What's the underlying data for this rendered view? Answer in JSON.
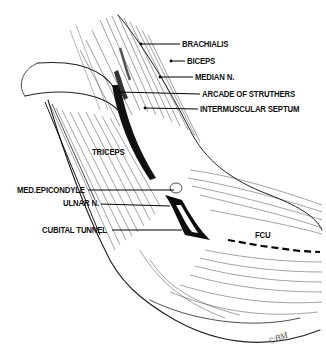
{
  "figure": {
    "signature": "©BM"
  },
  "labels": [
    {
      "id": "brachialis",
      "text": "BRACHIALIS",
      "x": 182,
      "y": 40,
      "lead": [
        [
          141,
          44
        ],
        [
          180,
          44
        ]
      ]
    },
    {
      "id": "biceps",
      "text": "BICEPS",
      "x": 187,
      "y": 57,
      "lead": [
        [
          171,
          61
        ],
        [
          185,
          61
        ]
      ]
    },
    {
      "id": "median-n",
      "text": "MEDIAN N.",
      "x": 195,
      "y": 73,
      "lead": [
        [
          160,
          77
        ],
        [
          193,
          77
        ]
      ]
    },
    {
      "id": "arcade-of-struthers",
      "text": "ARCADE OF STRUTHERS",
      "x": 202,
      "y": 90,
      "lead": [
        [
          118,
          92
        ],
        [
          200,
          94
        ]
      ]
    },
    {
      "id": "intermuscular-septum",
      "text": "INTERMUSCULAR SEPTUM",
      "x": 200,
      "y": 105,
      "lead": [
        [
          145,
          108
        ],
        [
          198,
          109
        ]
      ]
    },
    {
      "id": "triceps",
      "text": "TRICEPS",
      "x": 92,
      "y": 148,
      "lead": []
    },
    {
      "id": "med-epicondyle",
      "text": "MED.EPICONDYLE",
      "x": 17,
      "y": 186,
      "lead": [
        [
          88,
          190
        ],
        [
          174,
          190
        ]
      ]
    },
    {
      "id": "ulnar-n",
      "text": "ULNAR N.",
      "x": 63,
      "y": 199,
      "lead": [
        [
          101,
          204
        ],
        [
          170,
          206
        ]
      ]
    },
    {
      "id": "cubital-tunnel",
      "text": "CUBITAL TUNNEL",
      "x": 42,
      "y": 226,
      "lead": [
        [
          112,
          230
        ],
        [
          182,
          230
        ]
      ]
    },
    {
      "id": "fcu",
      "text": "FCU",
      "x": 255,
      "y": 231,
      "lead": []
    }
  ]
}
